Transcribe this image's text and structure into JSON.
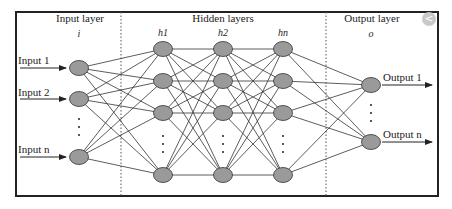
{
  "diagram": {
    "title_sections": {
      "input": "Input layer",
      "hidden": "Hidden layers",
      "output": "Output layer"
    },
    "layer_symbols": {
      "input": "i",
      "hidden": [
        "h1",
        "h2",
        "hn"
      ],
      "output": "o"
    },
    "inputs": [
      "Input 1",
      "Input 2",
      "Input n"
    ],
    "outputs": [
      "Output 1",
      "Output n"
    ],
    "colors": {
      "node_fill": "#9a9a9a",
      "node_stroke": "#333333",
      "edge": "#333333",
      "border": "#222222"
    }
  },
  "ui": {
    "close_button_glyph": "<"
  }
}
